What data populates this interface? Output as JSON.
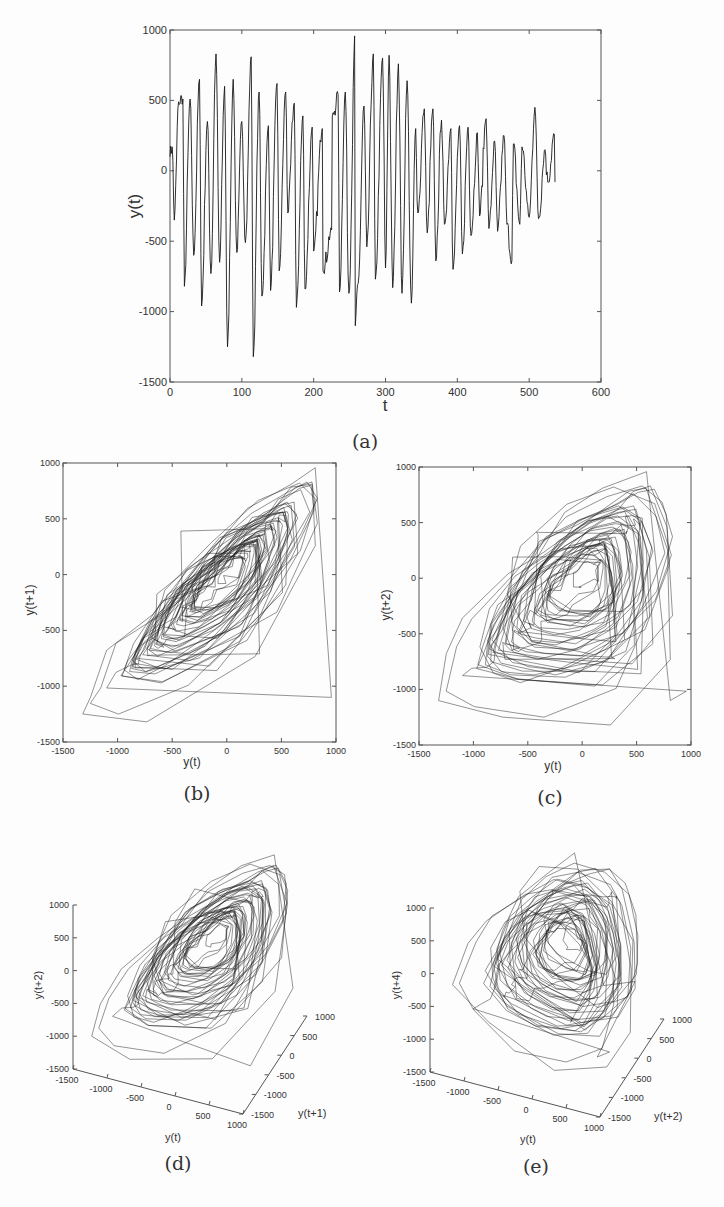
{
  "chart_data": [
    {
      "id": "a",
      "type": "line",
      "caption": "(a)",
      "title": "",
      "xlabel": "t",
      "ylabel": "y(t)",
      "xlim": [
        0,
        600
      ],
      "ylim": [
        -1500,
        1000
      ],
      "xticks": [
        0,
        100,
        200,
        300,
        400,
        500,
        600
      ],
      "yticks": [
        -1500,
        -1000,
        -500,
        0,
        500,
        1000
      ],
      "grid": false,
      "n_points": 537,
      "series_description": "oscillatory time series, ~45 cycles, amplitude largest near t=0-130 and t=250-340, decaying after t=400",
      "peaks": {
        "t": [
          3,
          12,
          18,
          28,
          41,
          52,
          64,
          76,
          88,
          100,
          113,
          124,
          137,
          149,
          161,
          173,
          185,
          198,
          212,
          226,
          234,
          244,
          258,
          270,
          283,
          296,
          305,
          318,
          330,
          342,
          354,
          366,
          378,
          391,
          403,
          415,
          428,
          440,
          452,
          465,
          478,
          490,
          508,
          522,
          535
        ],
        "y": [
          170,
          490,
          510,
          510,
          650,
          350,
          830,
          600,
          650,
          350,
          810,
          560,
          320,
          620,
          560,
          480,
          390,
          310,
          300,
          390,
          540,
          560,
          1000,
          460,
          830,
          800,
          820,
          760,
          640,
          300,
          440,
          440,
          360,
          300,
          320,
          310,
          270,
          370,
          210,
          250,
          190,
          170,
          450,
          150,
          260
        ]
      },
      "troughs": {
        "t": [
          6,
          20,
          33,
          44,
          57,
          69,
          80,
          93,
          105,
          116,
          128,
          140,
          152,
          164,
          176,
          188,
          200,
          213,
          225,
          236,
          249,
          258,
          262,
          274,
          286,
          300,
          310,
          323,
          336,
          345,
          358,
          370,
          382,
          394,
          407,
          419,
          431,
          444,
          456,
          469,
          476,
          487,
          500,
          513,
          526
        ],
        "y": [
          -350,
          -820,
          -600,
          -960,
          -730,
          -650,
          -1250,
          -580,
          -510,
          -1320,
          -890,
          -850,
          -710,
          -300,
          -970,
          -840,
          -570,
          -710,
          -420,
          -860,
          -870,
          -1100,
          -800,
          -540,
          -770,
          -690,
          -830,
          -870,
          -940,
          -300,
          -440,
          -640,
          -380,
          -700,
          -590,
          -460,
          -320,
          -410,
          -430,
          -380,
          -640,
          -380,
          -330,
          -340,
          -80
        ]
      }
    },
    {
      "id": "b",
      "type": "line",
      "caption": "(b)",
      "xlabel": "y(t)",
      "ylabel": "y(t+1)",
      "xlim": [
        -1500,
        1000
      ],
      "ylim": [
        -1500,
        1000
      ],
      "xticks": [
        -1500,
        -1000,
        -500,
        0,
        500,
        1000
      ],
      "yticks": [
        -1500,
        -1000,
        -500,
        0,
        500,
        1000
      ],
      "embedding_lag": 1,
      "series_description": "2D delay-embedding phase portrait of y(t) vs y(t+1)"
    },
    {
      "id": "c",
      "type": "line",
      "caption": "(c)",
      "xlabel": "y(t)",
      "ylabel": "y(t+2)",
      "xlim": [
        -1500,
        1000
      ],
      "ylim": [
        -1500,
        1000
      ],
      "xticks": [
        -1500,
        -1000,
        -500,
        0,
        500,
        1000
      ],
      "yticks": [
        -1500,
        -1000,
        -500,
        0,
        500,
        1000
      ],
      "embedding_lag": 2,
      "series_description": "2D delay-embedding phase portrait of y(t) vs y(t+2)"
    },
    {
      "id": "d",
      "type": "line",
      "caption": "(d)",
      "xlabel": "y(t)",
      "ylabel": "y(t+1)",
      "zlabel": "y(t+2)",
      "xlim": [
        -1500,
        1000
      ],
      "ylim": [
        -1500,
        1000
      ],
      "zlim": [
        -1500,
        1000
      ],
      "xticks": [
        -1500,
        -1000,
        -500,
        0,
        500,
        1000
      ],
      "yticks": [
        -1500,
        -1000,
        -500,
        0,
        500,
        1000
      ],
      "zticks": [
        -1500,
        -1000,
        -500,
        0,
        500,
        1000
      ],
      "embedding_lags": [
        0,
        1,
        2
      ],
      "series_description": "3D delay-embedding of (y(t), y(t+1), y(t+2))"
    },
    {
      "id": "e",
      "type": "line",
      "caption": "(e)",
      "xlabel": "y(t)",
      "ylabel": "y(t+2)",
      "zlabel": "y(t+4)",
      "xlim": [
        -1500,
        1000
      ],
      "ylim": [
        -1500,
        1000
      ],
      "zlim": [
        -1500,
        1000
      ],
      "xticks": [
        -1500,
        -1000,
        -500,
        0,
        500,
        1000
      ],
      "yticks": [
        -1500,
        -1000,
        -500,
        0,
        500,
        1000
      ],
      "zticks": [
        -1500,
        -1000,
        -500,
        0,
        500,
        1000
      ],
      "embedding_lags": [
        0,
        2,
        4
      ],
      "series_description": "3D delay-embedding of (y(t), y(t+2), y(t+4))"
    }
  ],
  "captions": {
    "a": "(a)",
    "b": "(b)",
    "c": "(c)",
    "d": "(d)",
    "e": "(e)"
  },
  "colors": {
    "line": "#1a1a1a",
    "axis": "#555555",
    "background": "#fdfdfd",
    "text": "#333333"
  }
}
